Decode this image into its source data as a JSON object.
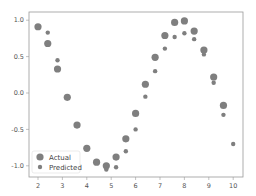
{
  "chart_data": {
    "type": "scatter",
    "title": "",
    "xlabel": "",
    "ylabel": "",
    "xlim": [
      1.6,
      10.4
    ],
    "ylim": [
      -1.15,
      1.1
    ],
    "grid": false,
    "legend_position": "lower left",
    "x_ticks": [
      "2",
      "3",
      "4",
      "5",
      "6",
      "7",
      "8",
      "9",
      "10"
    ],
    "y_ticks": [
      "1.0",
      "0.5",
      "0.0",
      "-0.5",
      "-1.0"
    ],
    "series": [
      {
        "name": "Actual",
        "marker_size": "large",
        "color": "#7f7f7f",
        "x": [
          2.0,
          2.4,
          2.8,
          3.2,
          3.6,
          4.0,
          4.4,
          4.8,
          5.2,
          5.6,
          6.0,
          6.4,
          6.8,
          7.2,
          7.6,
          8.0,
          8.4,
          8.8,
          9.2,
          9.6
        ],
        "y": [
          0.91,
          0.68,
          0.33,
          -0.06,
          -0.44,
          -0.76,
          -0.95,
          -1.0,
          -0.88,
          -0.63,
          -0.28,
          0.12,
          0.49,
          0.79,
          0.97,
          0.99,
          0.85,
          0.59,
          0.22,
          -0.17
        ]
      },
      {
        "name": "Predicted",
        "marker_size": "small",
        "color": "#7f7f7f",
        "x": [
          2.4,
          2.8,
          4.8,
          5.2,
          5.6,
          6.0,
          6.4,
          6.8,
          7.2,
          7.6,
          8.0,
          8.4,
          8.8,
          9.2,
          9.6,
          10.0
        ],
        "y": [
          0.83,
          0.45,
          -1.05,
          -1.02,
          -0.8,
          -0.5,
          -0.05,
          0.3,
          0.61,
          0.77,
          0.82,
          0.74,
          0.53,
          0.14,
          -0.3,
          -0.7
        ]
      }
    ]
  },
  "legend": {
    "items": [
      {
        "label": "Actual"
      },
      {
        "label": "Predicted"
      }
    ]
  },
  "axes": {
    "x_ticks": [
      "2",
      "3",
      "4",
      "5",
      "6",
      "7",
      "8",
      "9",
      "10"
    ],
    "y_ticks": [
      "1.0",
      "0.5",
      "0.0",
      "-0.5",
      "-1.0"
    ]
  }
}
